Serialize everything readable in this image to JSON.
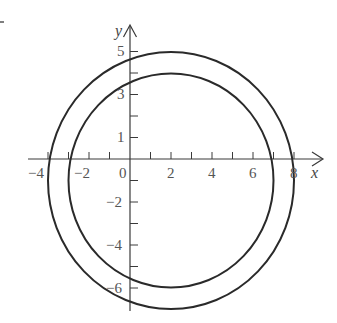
{
  "diagram": {
    "type": "coordinate-plane-with-two-circles",
    "axes": {
      "x_label": "x",
      "y_label": "y",
      "x_tick_labels": [
        "−4",
        "−2",
        "0",
        "2",
        "4",
        "6",
        "8"
      ],
      "y_tick_labels_positive": [
        "1",
        "3",
        "5"
      ],
      "y_tick_labels_negative": [
        "−2",
        "−4",
        "−6"
      ]
    },
    "circles": [
      {
        "name": "outer",
        "center": [
          2,
          -1
        ],
        "radius": 6
      },
      {
        "name": "inner",
        "center": [
          2,
          -1
        ],
        "radius": 5
      }
    ],
    "colors": {
      "curve": "#2a2a2a",
      "axis": "#3a3a3a",
      "label": "#555555"
    }
  }
}
